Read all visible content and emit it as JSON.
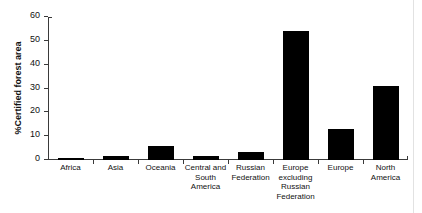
{
  "chart_data": {
    "type": "bar",
    "title": "",
    "subtitle": "",
    "xlabel": "",
    "ylabel": "%Certified forest area",
    "categories": [
      "Africa",
      "Asia",
      "Oceania",
      "Central and South America",
      "Russian Federation",
      "Europe excluding Russian Federation",
      "Europe",
      "North America"
    ],
    "values": [
      1,
      1.5,
      6,
      1.5,
      3.3,
      54,
      13,
      31
    ],
    "ylim": [
      0,
      60
    ],
    "yticks": [
      0,
      10,
      20,
      30,
      40,
      50,
      60
    ],
    "ytick_labels": [
      "0",
      "10",
      "20",
      "30",
      "40",
      "50",
      "60"
    ],
    "grid": false,
    "legend": null,
    "bar_color": "#000000",
    "axis_color": "#3a3a3a",
    "background_color": "#ffffff"
  }
}
